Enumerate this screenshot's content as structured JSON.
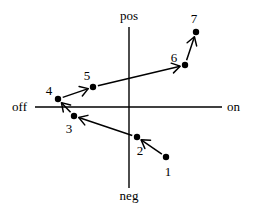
{
  "axes": {
    "top_label": "pos",
    "bottom_label": "neg",
    "left_label": "off",
    "right_label": "on"
  },
  "points": [
    {
      "id": "1",
      "label": "1",
      "x": 166,
      "y": 157,
      "lx": 168,
      "ly": 176
    },
    {
      "id": "2",
      "label": "2",
      "x": 137,
      "y": 137,
      "lx": 140,
      "ly": 155
    },
    {
      "id": "3",
      "label": "3",
      "x": 74,
      "y": 116,
      "lx": 69,
      "ly": 133
    },
    {
      "id": "4",
      "label": "4",
      "x": 58,
      "y": 99,
      "lx": 49,
      "ly": 95
    },
    {
      "id": "5",
      "label": "5",
      "x": 93,
      "y": 87,
      "lx": 87,
      "ly": 80
    },
    {
      "id": "6",
      "label": "6",
      "x": 185,
      "y": 65,
      "lx": 174,
      "ly": 62
    },
    {
      "id": "7",
      "label": "7",
      "x": 196,
      "y": 32,
      "lx": 194,
      "ly": 23
    }
  ],
  "transitions": [
    {
      "from": "1",
      "to": "2"
    },
    {
      "from": "2",
      "to": "3"
    },
    {
      "from": "3",
      "to": "4"
    },
    {
      "from": "4",
      "to": "5"
    },
    {
      "from": "5",
      "to": "6"
    },
    {
      "from": "6",
      "to": "7"
    }
  ]
}
